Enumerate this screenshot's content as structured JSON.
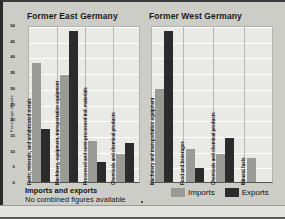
{
  "figure": {
    "caption_title": "Imports and exports",
    "caption_note": "No combined figures available",
    "legend": [
      {
        "label": "Imports",
        "color": "#9b9b95"
      },
      {
        "label": "Exports",
        "color": "#2b2b2b"
      }
    ]
  },
  "chart_data": [
    {
      "type": "bar",
      "title": "Former East Germany",
      "ylabel": "Percentage of trade",
      "xlabel": "",
      "ylim": [
        0,
        50
      ],
      "yticks": [
        0,
        5,
        10,
        15,
        20,
        25,
        30,
        35,
        40,
        45,
        50
      ],
      "grid": true,
      "legend_position": "bottom-right",
      "categories": [
        "Fuels, minerals, and unfabricated metals",
        "Machinery, equipment, transportation equipment",
        "Processed and semi-processed ind. materials",
        "Chemicals and chemical products"
      ],
      "series": [
        {
          "name": "Imports",
          "color": "#9b9b95",
          "values": [
            38,
            34,
            13,
            9
          ]
        },
        {
          "name": "Exports",
          "color": "#2b2b2b",
          "values": [
            17,
            48,
            6.5,
            12.5
          ]
        }
      ]
    },
    {
      "type": "bar",
      "title": "Former West Germany",
      "ylabel": "Percentage of trade",
      "xlabel": "",
      "ylim": [
        0,
        50
      ],
      "yticks": [
        0,
        5,
        10,
        15,
        20,
        25,
        30,
        35,
        40,
        45,
        50
      ],
      "grid": true,
      "legend_position": "bottom-right",
      "categories": [
        "Machinery and transportation equipment",
        "Food and beverages",
        "Chemicals and chemical products",
        "Mineral fuels"
      ],
      "series": [
        {
          "name": "Imports",
          "color": "#9b9b95",
          "values": [
            29.5,
            10.5,
            9,
            7.5
          ]
        },
        {
          "name": "Exports",
          "color": "#2b2b2b",
          "values": [
            48,
            4.5,
            14,
            null
          ]
        }
      ]
    }
  ]
}
